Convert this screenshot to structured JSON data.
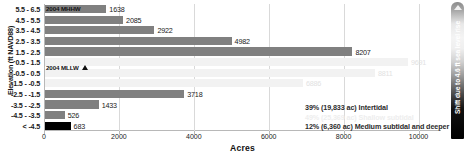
{
  "chart_data": {
    "type": "bar",
    "orientation": "horizontal",
    "title": "",
    "xlabel": "Acres",
    "ylabel": "Elevation (ft NAVD88)",
    "xlim": [
      0,
      10600
    ],
    "ylim": null,
    "grid": true,
    "legend": "none",
    "xticks": [
      "0",
      "2000",
      "4000",
      "6000",
      "8000",
      "10000"
    ],
    "xtick_values": [
      0,
      2000,
      4000,
      6000,
      8000,
      10000
    ],
    "categories": [
      "5.5 - 6.5",
      "4.5 - 5.5",
      "3.5 - 4.5",
      "2.5 - 3.5",
      "1.5 - 2.5",
      "0.5 - 1.5",
      "-0.5 - 0.5",
      "-1.5 - -0.5",
      "-2.5 - -1.5",
      "-3.5 - -2.5",
      "-4.5 - -3.5",
      "< -4.5"
    ],
    "values": [
      1638,
      2085,
      2922,
      4982,
      8207,
      9691,
      8811,
      6886,
      3718,
      1433,
      526,
      683
    ],
    "value_labels": [
      "1638",
      "2085",
      "2922",
      "4982",
      "8207",
      "9691",
      "8811",
      "6886",
      "3718",
      "1433",
      "526",
      "683"
    ],
    "bar_colors": [
      "#808080",
      "#808080",
      "#808080",
      "#808080",
      "#808080",
      "#f2f2f2",
      "#f2f2f2",
      "#f2f2f2",
      "#808080",
      "#808080",
      "#808080",
      "#000000"
    ],
    "label_faint": [
      false,
      false,
      false,
      false,
      false,
      true,
      true,
      true,
      false,
      false,
      false,
      false
    ],
    "annotations": [
      {
        "id": "intertidal",
        "text": "39% (19,833 ac) Intertidal",
        "color": "#2b2b2b"
      },
      {
        "id": "shallow_subtidal",
        "text": "49% (25,369 ac) Shallow subtidal",
        "color": "#eeeeee"
      },
      {
        "id": "medium_subtidal",
        "text": "12% (6,360 ac) Medium subtidal and deeper",
        "color": "#2b2b2b"
      }
    ],
    "datum_markers": [
      {
        "id": "mhhw",
        "label": "2004 MHHW",
        "marker": "none"
      },
      {
        "id": "mllw",
        "label": "2004 MLLW",
        "marker": "triangle-up-icon"
      }
    ],
    "side_bar": {
      "label": "Shift due to 4.6 ft sea level rise",
      "arrow": "arrow-up-icon"
    }
  }
}
